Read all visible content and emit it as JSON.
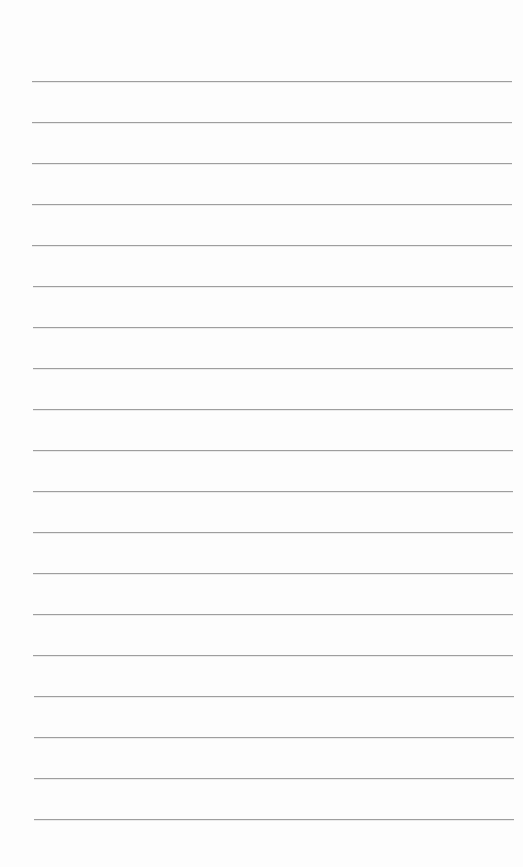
{
  "document": {
    "type": "lined-paper",
    "background_color": "#fdfdfd",
    "line_color": "#9e9e9e",
    "line_count": 19,
    "first_line_y": 81,
    "line_spacing": 41,
    "line_left": 32,
    "line_width": 480
  }
}
